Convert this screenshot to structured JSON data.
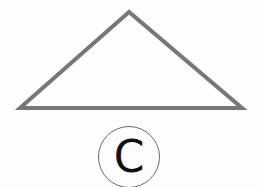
{
  "figure": {
    "shape": "triangle",
    "vertices": [
      [
        129,
        12
      ],
      [
        20,
        108
      ],
      [
        242,
        108
      ]
    ],
    "stroke_color": "#777777",
    "stroke_width": 4,
    "fill": "none"
  },
  "option": {
    "label": "C",
    "style": "circled-letter"
  }
}
